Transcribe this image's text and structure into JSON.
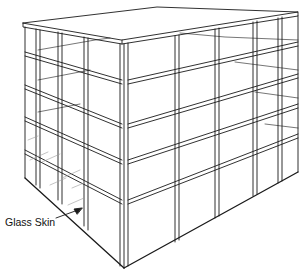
{
  "diagram": {
    "labels": {
      "glass_skin": "Glass Skin"
    },
    "colors": {
      "line": "#1a1a1a",
      "background": "#ffffff",
      "glass_hatch": "#9a9a9a"
    }
  }
}
